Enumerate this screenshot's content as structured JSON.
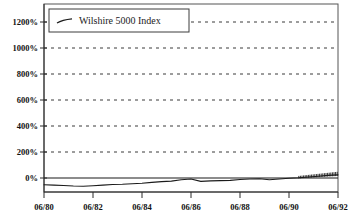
{
  "chart_data": {
    "type": "line",
    "title": "",
    "subtitle": "",
    "xlabel": "",
    "ylabel": "",
    "grid": true,
    "legend_position": "top-left",
    "ylim": [
      -100,
      1250
    ],
    "yticks": [
      0,
      200,
      400,
      600,
      800,
      1000,
      1200
    ],
    "ytick_labels": [
      "0%",
      "200%",
      "400%",
      "600%",
      "800%",
      "1000%",
      "1200%"
    ],
    "xticks": [
      "06/80",
      "06/82",
      "06/84",
      "06/86",
      "06/88",
      "06/90",
      "06/92"
    ],
    "xtick_labels": [
      "06/80",
      "06/82",
      "06/84",
      "06/86",
      "06/88",
      "06/90",
      "06/92"
    ],
    "xlim": [
      "06/80",
      "06/92"
    ],
    "series": [
      {
        "name": "Wilshire 5000 Index",
        "color": "#1b1b1b",
        "x": [
          "06/80",
          "12/80",
          "06/81",
          "12/81",
          "06/82",
          "12/82",
          "06/83",
          "12/83",
          "06/84",
          "12/84",
          "06/85",
          "12/85",
          "06/86",
          "12/86",
          "06/87",
          "09/87",
          "12/87",
          "03/88",
          "06/88",
          "12/88",
          "06/89",
          "12/89",
          "06/90",
          "09/90",
          "12/90",
          "03/91",
          "06/91",
          "09/91",
          "12/91",
          "03/92",
          "06/92"
        ],
        "values": [
          -52,
          -55,
          -58,
          -62,
          -64,
          -60,
          -55,
          -50,
          -48,
          -44,
          -40,
          -34,
          -28,
          -24,
          -14,
          -8,
          -26,
          -22,
          -20,
          -18,
          -12,
          -8,
          -6,
          -14,
          -8,
          -2,
          2,
          8,
          14,
          20,
          24
        ]
      }
    ],
    "annotations": []
  },
  "legend": {
    "entries": [
      {
        "label": "Wilshire 5000 Index"
      }
    ]
  },
  "axes": {
    "y_unit": "%",
    "x_unit": "month/year"
  }
}
